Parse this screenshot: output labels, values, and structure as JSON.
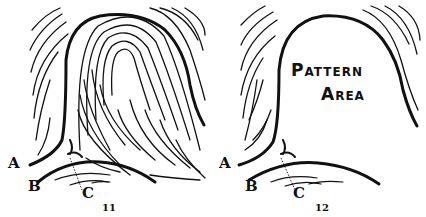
{
  "figures": [
    {
      "number": "11",
      "labels": {
        "a": "A",
        "b": "B",
        "c": "C"
      }
    },
    {
      "number": "12",
      "labels": {
        "a": "A",
        "b": "B",
        "c": "C"
      },
      "area_label": {
        "line1": "Pattern",
        "line2": "Area"
      }
    }
  ],
  "colors": {
    "ink": "#111111",
    "paper": "#ffffff"
  }
}
